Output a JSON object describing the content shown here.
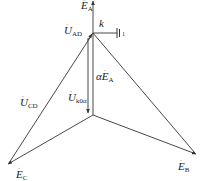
{
  "diagram": {
    "type": "phasor-diagram",
    "stroke_color": "#333333",
    "labels": {
      "E_A": {
        "main": "E",
        "sub": "A"
      },
      "U_AD": {
        "main": "U",
        "sub": "AD"
      },
      "k": {
        "main": "k"
      },
      "ground_one": {
        "main": "1"
      },
      "alpha_E_A": {
        "prefix": "α",
        "main": "E",
        "sub": "A"
      },
      "U_CD": {
        "main": "U",
        "sub": "CD"
      },
      "U_k0a": {
        "main": "U",
        "sub": "k0α"
      },
      "E_C": {
        "main": "E",
        "sub": "C"
      },
      "E_B": {
        "main": "E",
        "sub": "B"
      }
    },
    "nodes": {
      "A_top": [
        93,
        1
      ],
      "k": [
        93,
        33
      ],
      "N_center": [
        93,
        115
      ],
      "C": [
        8,
        164
      ],
      "B": [
        196,
        154
      ]
    }
  }
}
